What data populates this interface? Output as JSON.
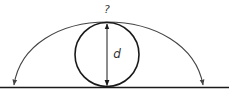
{
  "diagram": {
    "type": "geometry-figure",
    "labels": {
      "top": "?",
      "diameter": "d"
    },
    "elements": {
      "ground_line": {
        "y": 87,
        "x1": 0,
        "x2": 229
      },
      "circle": {
        "cx": 107,
        "cy": 54.5,
        "r": 32
      },
      "arc": {
        "start_x": 14,
        "peak_x": 107,
        "peak_y": 22,
        "end_x": 203,
        "end_y": 86
      },
      "diameter_arrow": {
        "x": 107,
        "y1": 23,
        "y2": 86
      }
    },
    "colors": {
      "stroke": "#1a1a1a",
      "arc": "#444444",
      "text": "#333333"
    }
  }
}
